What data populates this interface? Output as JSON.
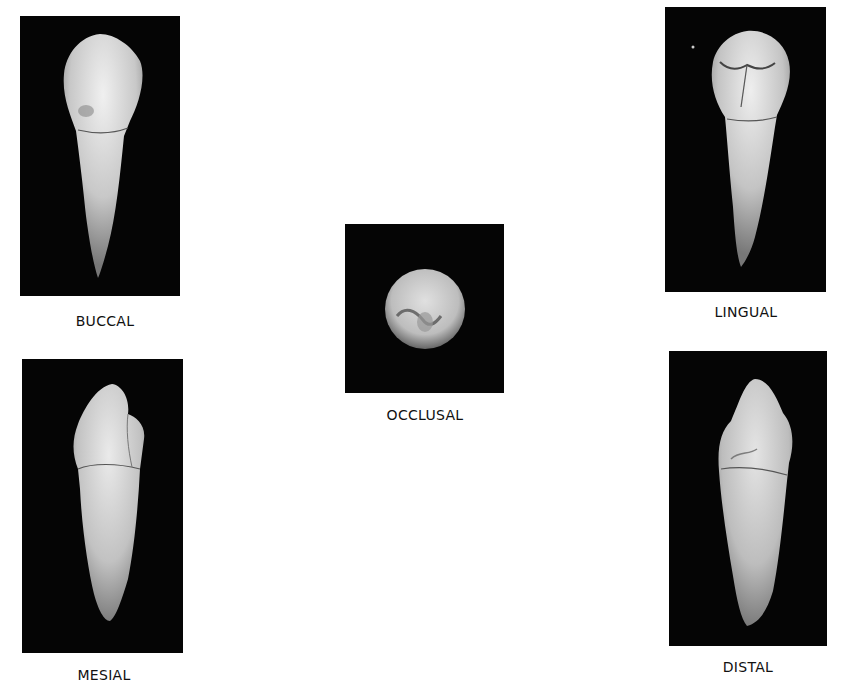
{
  "figure": {
    "views": [
      {
        "id": "buccal",
        "label": "BUCCAL"
      },
      {
        "id": "lingual",
        "label": "LINGUAL"
      },
      {
        "id": "occlusal",
        "label": "OCCLUSAL"
      },
      {
        "id": "mesial",
        "label": "MESIAL"
      },
      {
        "id": "distal",
        "label": "DISTAL"
      }
    ],
    "colors": {
      "background": "#ffffff",
      "photo_background": "#050505",
      "tooth": "#d8d8d8",
      "text": "#111111"
    }
  }
}
